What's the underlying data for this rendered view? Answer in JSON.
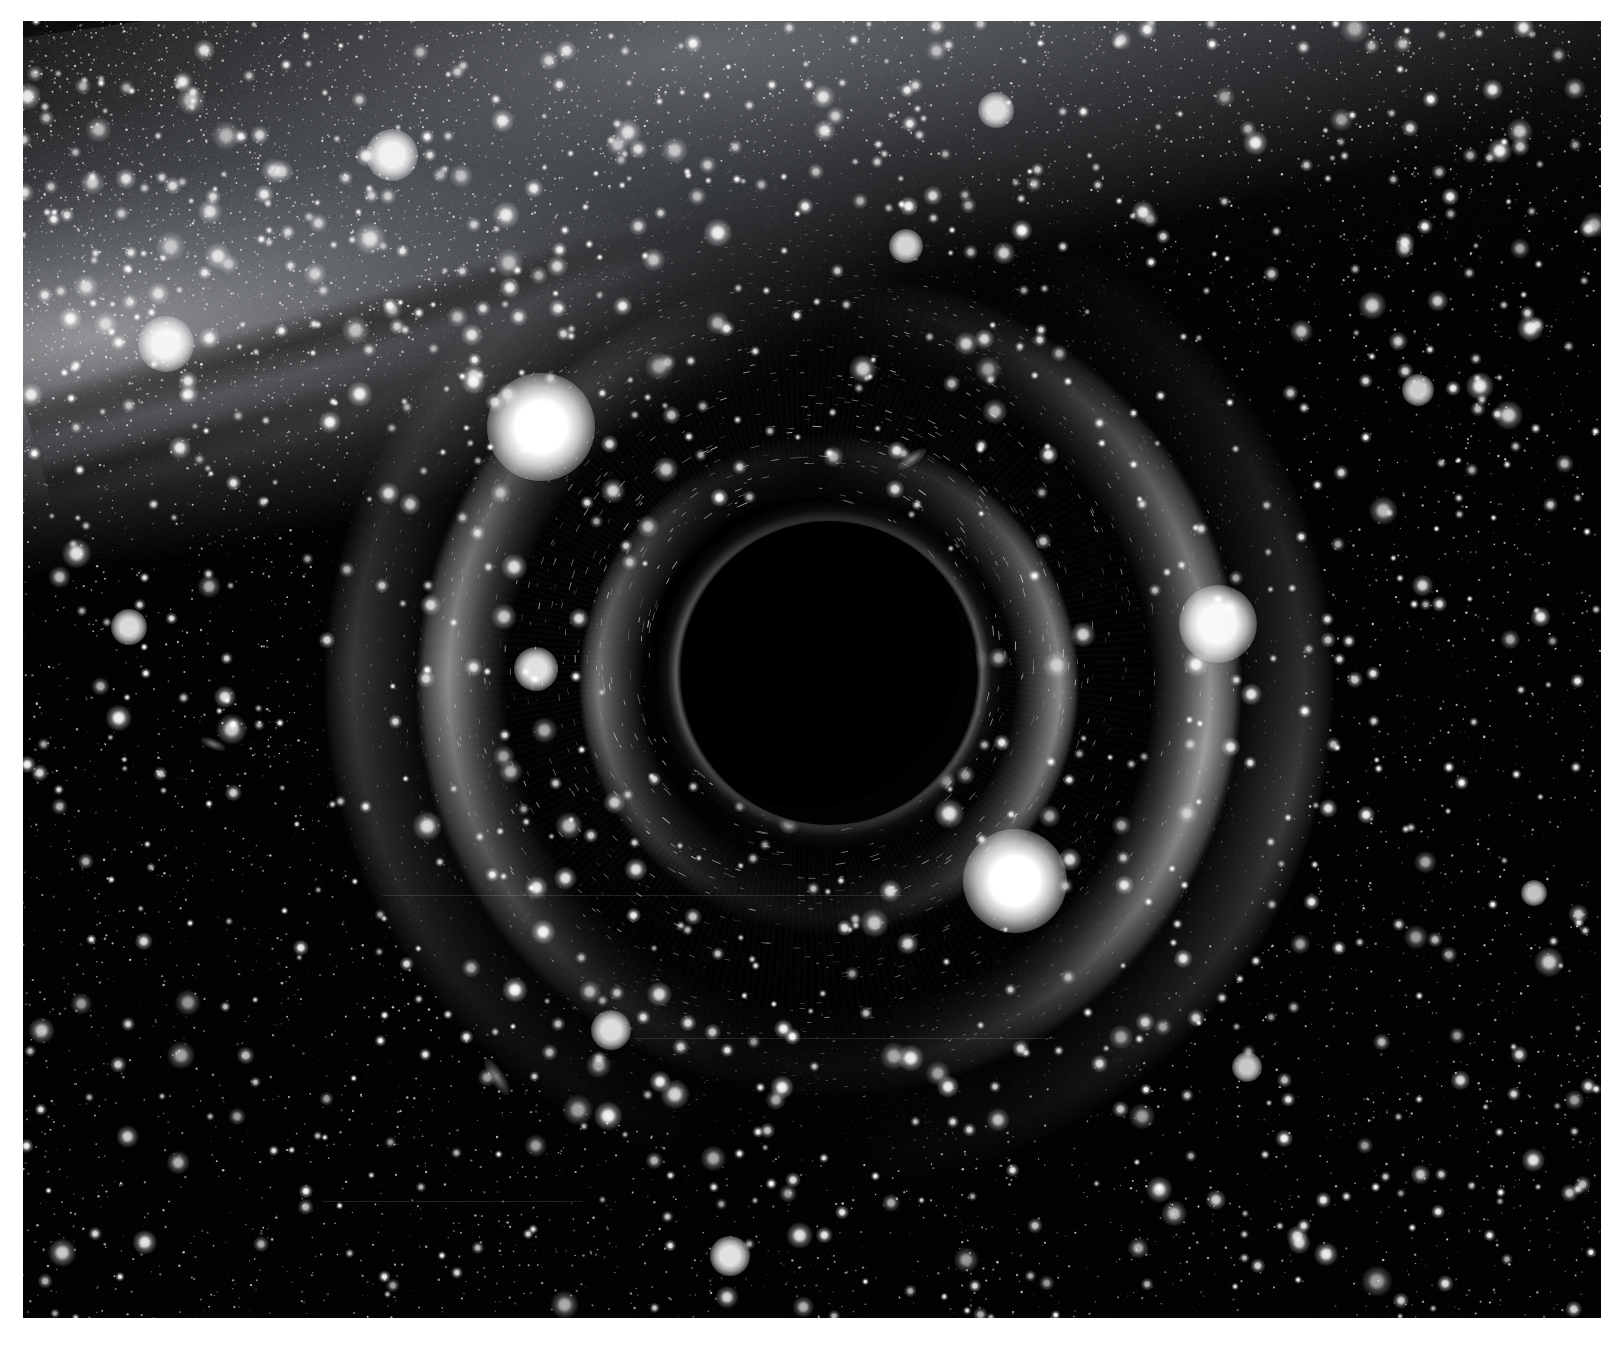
{
  "page": {
    "width": 1621,
    "height": 1347,
    "background": "#ffffff",
    "caption": ""
  },
  "frame": {
    "name": "lensed-starfield-plate",
    "left": 23,
    "top": 21,
    "width": 1578,
    "height": 1297,
    "sky_color": "#000000",
    "rendering": "monochrome greyscale raytraced image"
  },
  "scene": {
    "subject": "Schwarzschild black hole silhouetted against a dense star field",
    "shadow": {
      "name": "event-horizon-shadow",
      "center_x": 806,
      "center_y": 652,
      "radius_x": 148,
      "radius_y": 152,
      "fill": "#000000"
    },
    "photon_ring": {
      "name": "photon-ring",
      "outer_radius": 174,
      "brightness": "bright thin white rim, strongest on the right and lower-right limb",
      "color": "#ffffff"
    },
    "einstein_arcs": [
      {
        "name": "outer-halo-arc",
        "radius": 506,
        "peak_sector": "upper-right and lower-left",
        "intensity": 0.22
      },
      {
        "name": "primary-lensed-arc",
        "radius": 414,
        "peak_sector": "lower-right and left",
        "intensity": 0.62
      },
      {
        "name": "inner-lensed-arc",
        "radius": 251,
        "peak_sector": "right and lower-left",
        "intensity": 0.54
      }
    ],
    "galaxy_band": {
      "name": "milky-way-band",
      "description": "diffuse luminous galactic band entering from the upper-left corner and sweeping across the top of the frame",
      "dust_lane": "dark dust lane running along the core of the band in the upper-left",
      "tilt_degrees": -8
    },
    "radial_streaks": {
      "name": "lensed-star-streaks",
      "description": "fine radial smearing of background stars in the annulus just outside the photon ring"
    }
  },
  "bright_stars": [
    {
      "name": "bright-star-upper-left-of-shadow",
      "x": 541,
      "y": 427,
      "size": 108,
      "brightness": 1.0
    },
    {
      "name": "bright-star-lower-right-of-shadow",
      "x": 1015,
      "y": 881,
      "size": 104,
      "brightness": 1.0
    },
    {
      "name": "bright-star-right-field",
      "x": 1218,
      "y": 624,
      "size": 78,
      "brightness": 0.96
    },
    {
      "name": "bright-star-upper-left-field",
      "x": 166,
      "y": 344,
      "size": 56,
      "brightness": 0.92
    },
    {
      "name": "bright-star-top-band",
      "x": 392,
      "y": 155,
      "size": 52,
      "brightness": 0.92
    },
    {
      "name": "bright-star-mid-left",
      "x": 536,
      "y": 669,
      "size": 44,
      "brightness": 0.88
    },
    {
      "name": "bright-star-left-field",
      "x": 129,
      "y": 627,
      "size": 36,
      "brightness": 0.85
    },
    {
      "name": "bright-star-lower-left",
      "x": 611,
      "y": 1030,
      "size": 40,
      "brightness": 0.86
    },
    {
      "name": "bright-star-bottom-center",
      "x": 730,
      "y": 1256,
      "size": 40,
      "brightness": 0.88
    },
    {
      "name": "bright-star-top-right-band",
      "x": 996,
      "y": 110,
      "size": 36,
      "brightness": 0.84
    },
    {
      "name": "bright-star-upper-mid",
      "x": 906,
      "y": 246,
      "size": 34,
      "brightness": 0.82
    },
    {
      "name": "bright-star-right-upper",
      "x": 1418,
      "y": 390,
      "size": 32,
      "brightness": 0.8
    },
    {
      "name": "bright-star-right-lower",
      "x": 1247,
      "y": 1067,
      "size": 30,
      "brightness": 0.78
    },
    {
      "name": "bright-star-far-right",
      "x": 1534,
      "y": 893,
      "size": 26,
      "brightness": 0.76
    }
  ],
  "galaxy_smudges": [
    {
      "name": "lensed-galaxy-smudge-upper-right",
      "x": 912,
      "y": 459,
      "w": 34,
      "h": 12,
      "rotate": -34
    },
    {
      "name": "lensed-galaxy-smudge-lower-left",
      "x": 497,
      "y": 1077,
      "w": 42,
      "h": 14,
      "rotate": 58
    },
    {
      "name": "lensed-galaxy-smudge-left",
      "x": 213,
      "y": 744,
      "w": 26,
      "h": 10,
      "rotate": 22
    }
  ],
  "colors": {
    "page_background": "#ffffff",
    "sky": "#000000",
    "star_white": "#ffffff",
    "galaxy_glow": "#e1e4e8",
    "photon_ring": "#ffffff"
  }
}
